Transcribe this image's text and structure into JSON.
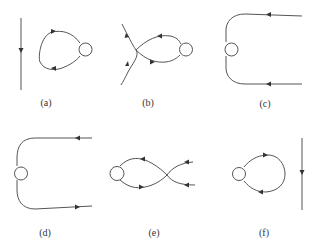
{
  "figure": {
    "panels": [
      {
        "id": "a",
        "label": "(a)",
        "description": "vertical line with downward arrow beside a loop attached to a circle"
      },
      {
        "id": "b",
        "label": "(b)",
        "description": "crossing line into a loop attached to a circle"
      },
      {
        "id": "c",
        "label": "(c)",
        "description": "two horizontal lines curving around a circle on the left"
      },
      {
        "id": "d",
        "label": "(d)",
        "description": "two horizontal lines curving around a circle on the left"
      },
      {
        "id": "e",
        "label": "(e)",
        "description": "circle with two crossing lines forming a figure-eight"
      },
      {
        "id": "f",
        "label": "(f)",
        "description": "loop attached to a circle beside a vertical line with downward arrow"
      }
    ]
  }
}
